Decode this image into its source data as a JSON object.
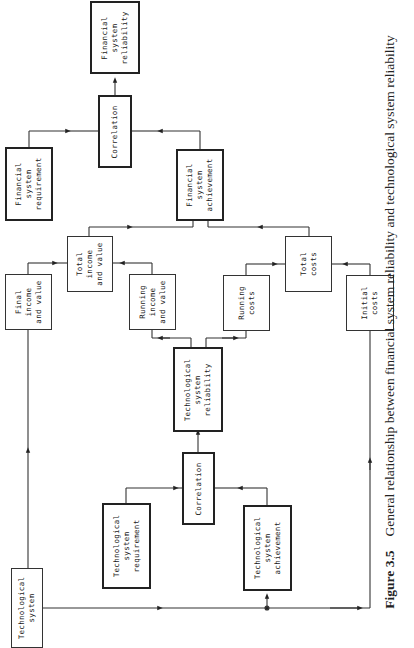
{
  "figure": {
    "number": "Figure 3.5",
    "caption": "General relationship between financial system reliability and technological system reliability"
  },
  "boxes": {
    "financial_reliability": "Financial\nsystem\nreliability",
    "financial_correlation": "Correlation",
    "financial_requirement": "Financial\nsystem\nrequirement",
    "financial_achievement": "Financial\nsystem\nachievement",
    "total_income": "Total\nincome\nand value",
    "final_income": "Final\nincome\nand value",
    "running_income": "Running\nincome\nand value",
    "running_costs": "Running\ncosts",
    "total_costs": "Total\ncosts",
    "initial_costs": "Initial\ncosts",
    "tech_reliability": "Technological\nsystem\nreliability",
    "tech_correlation": "Correlation",
    "tech_requirement": "Technological\nsystem\nrequirement",
    "tech_achievement": "Technological\nsystem\nachievement",
    "tech_system": "Technological\nsystem"
  }
}
